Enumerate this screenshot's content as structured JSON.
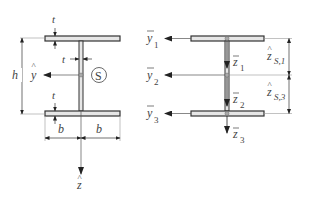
{
  "left_figure": {
    "labels": {
      "t_top": "t",
      "t_web": "t",
      "t_bottom": "t",
      "h": "h",
      "y_hat": "y",
      "y_hat_accent": "^",
      "shear_center": "S",
      "b_left": "b",
      "b_right": "b",
      "z_hat": "z",
      "z_hat_accent": "^"
    }
  },
  "right_figure": {
    "labels": {
      "y1": "y",
      "y1_sub": "1",
      "y2": "y",
      "y2_sub": "2",
      "y3": "y",
      "y3_sub": "3",
      "z1": "z",
      "z1_sub": "1",
      "z2": "z",
      "z2_sub": "2",
      "z3": "z",
      "z3_sub": "3",
      "zs1": "z",
      "zs1_sub": "S,1",
      "zs3": "z",
      "zs3_sub": "S,3",
      "accent_hat": "^",
      "accent_bar": "‾"
    }
  },
  "colors": {
    "flange_fill": "#e6e6e6",
    "outline": "#333333",
    "line": "#555555"
  }
}
